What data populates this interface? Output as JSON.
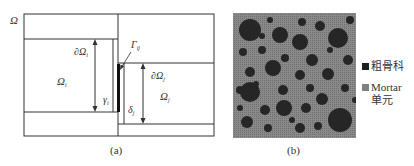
{
  "panel_a": {
    "caption": "(a)",
    "domain_label": "Ω",
    "labels": {
      "boundary_i": "∂Ω",
      "boundary_i_sub": "i",
      "domain_i": "Ω",
      "domain_i_sub": "i",
      "gamma_i": "γ",
      "gamma_i_sub": "i",
      "interface": "Γ",
      "interface_sub": "ij",
      "boundary_j": "∂Ω",
      "boundary_j_sub": "j",
      "domain_j": "Ω",
      "domain_j_sub": "j",
      "delta_j": "δ",
      "delta_j_sub": "j"
    }
  },
  "panel_b": {
    "caption": "(b)",
    "colors": {
      "background": "#7a7a7a",
      "aggregate": "#262626"
    },
    "legend": [
      {
        "label": "粗骨科",
        "color": "#1e1e1e"
      },
      {
        "label": "Mortar\n单元",
        "color": "#808080"
      }
    ]
  }
}
